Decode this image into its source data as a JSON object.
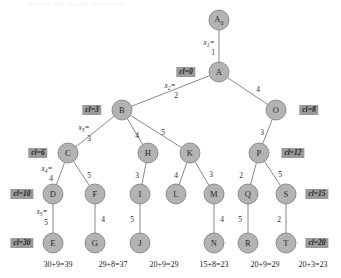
{
  "figure": {
    "header_faint_text": "Branch and Bound search tree",
    "background_color": "#ffffff",
    "node_fill_color": "#b3b3b3",
    "node_stroke_color": "#6e6e6e",
    "edge_color": "#7a7a7a",
    "badge_color": "#9a9a9a",
    "text_color": "#2b2b2b"
  },
  "nodes": [
    {
      "id": "A0",
      "label": "A",
      "subscript": "0",
      "x": 219,
      "y": 20,
      "r": 10
    },
    {
      "id": "A",
      "label": "A",
      "subscript": "",
      "x": 219,
      "y": 72,
      "r": 10
    },
    {
      "id": "B",
      "label": "B",
      "subscript": "",
      "x": 122,
      "y": 110,
      "r": 10
    },
    {
      "id": "O",
      "label": "O",
      "subscript": "",
      "x": 276,
      "y": 110,
      "r": 10
    },
    {
      "id": "C",
      "label": "C",
      "subscript": "",
      "x": 68,
      "y": 153,
      "r": 10
    },
    {
      "id": "H",
      "label": "H",
      "subscript": "",
      "x": 148,
      "y": 153,
      "r": 10
    },
    {
      "id": "K",
      "label": "K",
      "subscript": "",
      "x": 190,
      "y": 153,
      "r": 10
    },
    {
      "id": "P",
      "label": "P",
      "subscript": "",
      "x": 259,
      "y": 153,
      "r": 10
    },
    {
      "id": "D",
      "label": "D",
      "subscript": "",
      "x": 53,
      "y": 194,
      "r": 10
    },
    {
      "id": "F",
      "label": "F",
      "subscript": "",
      "x": 95,
      "y": 194,
      "r": 10
    },
    {
      "id": "I",
      "label": "I",
      "subscript": "",
      "x": 140,
      "y": 194,
      "r": 10
    },
    {
      "id": "L",
      "label": "L",
      "subscript": "",
      "x": 176,
      "y": 194,
      "r": 10
    },
    {
      "id": "M",
      "label": "M",
      "subscript": "",
      "x": 214,
      "y": 194,
      "r": 10
    },
    {
      "id": "Q",
      "label": "Q",
      "subscript": "",
      "x": 248,
      "y": 194,
      "r": 10
    },
    {
      "id": "S",
      "label": "S",
      "subscript": "",
      "x": 286,
      "y": 194,
      "r": 10
    },
    {
      "id": "E",
      "label": "E",
      "subscript": "",
      "x": 53,
      "y": 243,
      "r": 10
    },
    {
      "id": "G",
      "label": "G",
      "subscript": "",
      "x": 95,
      "y": 243,
      "r": 10
    },
    {
      "id": "J",
      "label": "J",
      "subscript": "",
      "x": 140,
      "y": 243,
      "r": 10
    },
    {
      "id": "N",
      "label": "N",
      "subscript": "",
      "x": 214,
      "y": 243,
      "r": 10
    },
    {
      "id": "R",
      "label": "R",
      "subscript": "",
      "x": 248,
      "y": 243,
      "r": 10
    },
    {
      "id": "T",
      "label": "T",
      "subscript": "",
      "x": 286,
      "y": 243,
      "r": 10
    }
  ],
  "edges": [
    {
      "from": "A0",
      "to": "A",
      "weight": "1",
      "wx": 213,
      "wy": 52
    },
    {
      "from": "A",
      "to": "B",
      "weight": "2",
      "wx": 176,
      "wy": 95
    },
    {
      "from": "A",
      "to": "O",
      "weight": "4",
      "wx": 258,
      "wy": 89
    },
    {
      "from": "B",
      "to": "C",
      "weight": "3",
      "wx": 89,
      "wy": 138
    },
    {
      "from": "B",
      "to": "H",
      "weight": "4",
      "wx": 137,
      "wy": 135
    },
    {
      "from": "B",
      "to": "K",
      "weight": "5",
      "wx": 163,
      "wy": 132
    },
    {
      "from": "O",
      "to": "P",
      "weight": "3",
      "wx": 262,
      "wy": 132
    },
    {
      "from": "C",
      "to": "D",
      "weight": "4",
      "wx": 51,
      "wy": 178
    },
    {
      "from": "C",
      "to": "F",
      "weight": "5",
      "wx": 89,
      "wy": 175
    },
    {
      "from": "H",
      "to": "I",
      "weight": "3",
      "wx": 137,
      "wy": 175
    },
    {
      "from": "K",
      "to": "L",
      "weight": "4",
      "wx": 176,
      "wy": 175
    },
    {
      "from": "K",
      "to": "M",
      "weight": "3",
      "wx": 211,
      "wy": 174
    },
    {
      "from": "P",
      "to": "Q",
      "weight": "2",
      "wx": 241,
      "wy": 175
    },
    {
      "from": "P",
      "to": "S",
      "weight": "5",
      "wx": 280,
      "wy": 174
    },
    {
      "from": "D",
      "to": "E",
      "weight": "5",
      "wx": 46,
      "wy": 222
    },
    {
      "from": "F",
      "to": "G",
      "weight": "4",
      "wx": 103,
      "wy": 219
    },
    {
      "from": "I",
      "to": "J",
      "weight": "5",
      "wx": 132,
      "wy": 219
    },
    {
      "from": "M",
      "to": "N",
      "weight": "4",
      "wx": 222,
      "wy": 219
    },
    {
      "from": "Q",
      "to": "R",
      "weight": "5",
      "wx": 240,
      "wy": 219
    },
    {
      "from": "S",
      "to": "T",
      "weight": "2",
      "wx": 279,
      "wy": 219
    }
  ],
  "variable_labels": [
    {
      "name": "x",
      "subscript": "1",
      "x": 209,
      "y": 43
    },
    {
      "name": "x",
      "subscript": "2",
      "x": 170,
      "y": 86
    },
    {
      "name": "x",
      "subscript": "3",
      "x": 84,
      "y": 128
    },
    {
      "name": "x",
      "subscript": "4",
      "x": 47,
      "y": 169
    },
    {
      "name": "x",
      "subscript": "5",
      "x": 42,
      "y": 212
    }
  ],
  "cost_badges": [
    {
      "text": "cl=0",
      "x": 186,
      "y": 72
    },
    {
      "text": "cl=3",
      "x": 92,
      "y": 110
    },
    {
      "text": "cl=8",
      "x": 309,
      "y": 110
    },
    {
      "text": "cl=6",
      "x": 38,
      "y": 153
    },
    {
      "text": "cl=12",
      "x": 293,
      "y": 153
    },
    {
      "text": "cl=10",
      "x": 22,
      "y": 194
    },
    {
      "text": "cl=15",
      "x": 317,
      "y": 194
    },
    {
      "text": "cl=30",
      "x": 22,
      "y": 243
    },
    {
      "text": "cl=20",
      "x": 317,
      "y": 243
    }
  ],
  "sums": [
    {
      "text": "30+9=39",
      "x": 58,
      "y": 264
    },
    {
      "text": "29+8=37",
      "x": 113,
      "y": 264
    },
    {
      "text": "20+9=29",
      "x": 164,
      "y": 264
    },
    {
      "text": "15+8=23",
      "x": 214,
      "y": 264
    },
    {
      "text": "20+9=29",
      "x": 265,
      "y": 264
    },
    {
      "text": "20+3=23",
      "x": 313,
      "y": 264
    }
  ]
}
